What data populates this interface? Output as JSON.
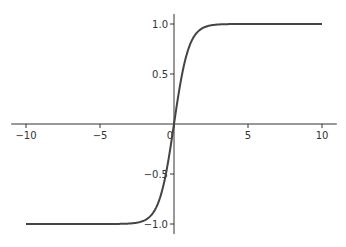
{
  "chart_data": {
    "type": "line",
    "title": "",
    "xlabel": "",
    "ylabel": "",
    "function": "tanh(x)",
    "xlim": [
      -11,
      11
    ],
    "ylim": [
      -1.1,
      1.1
    ],
    "grid": false,
    "legend": null,
    "spines": "centered",
    "x_ticks": [
      -10,
      -5,
      0,
      5,
      10
    ],
    "x_tick_labels": [
      "−10",
      "−5",
      "0",
      "5",
      "10"
    ],
    "y_ticks": [
      -1.0,
      -0.5,
      0.5,
      1.0
    ],
    "y_tick_labels": [
      "−1.0",
      "−0.5",
      "0.5",
      "1.0"
    ],
    "series": [
      {
        "name": "tanh",
        "color": "#444444",
        "x": [
          -10,
          -8,
          -6,
          -5,
          -4,
          -3,
          -2.5,
          -2,
          -1.5,
          -1.25,
          -1,
          -0.75,
          -0.5,
          -0.25,
          0,
          0.25,
          0.5,
          0.75,
          1,
          1.25,
          1.5,
          2,
          2.5,
          3,
          4,
          5,
          6,
          8,
          10
        ],
        "values": [
          -1.0,
          -1.0,
          -1.0,
          -0.9999,
          -0.9993,
          -0.9951,
          -0.9866,
          -0.964,
          -0.9051,
          -0.8483,
          -0.7616,
          -0.6351,
          -0.4621,
          -0.2449,
          0.0,
          0.2449,
          0.4621,
          0.6351,
          0.7616,
          0.8483,
          0.9051,
          0.964,
          0.9866,
          0.9951,
          0.9993,
          0.9999,
          1.0,
          1.0,
          1.0
        ]
      }
    ]
  },
  "colors": {
    "axis": "#333333",
    "line": "#444444",
    "background": "#ffffff"
  }
}
